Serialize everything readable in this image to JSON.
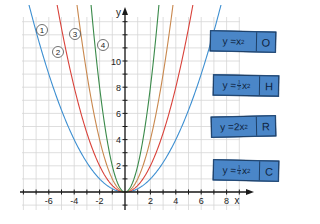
{
  "chart_data": {
    "type": "line",
    "title": "",
    "xlabel": "x",
    "ylabel": "y",
    "xlim": [
      -8,
      9
    ],
    "ylim": [
      -1,
      13.5
    ],
    "grid": true,
    "x_ticks": [
      -6,
      -4,
      -2,
      2,
      4,
      6,
      8
    ],
    "y_ticks": [
      2,
      4,
      6,
      8,
      10
    ],
    "series": [
      {
        "name": "1",
        "marker_label": "①",
        "color": "#3d8fd1",
        "function": "y = 1/4 x^2",
        "a": 0.25
      },
      {
        "name": "2",
        "marker_label": "②",
        "color": "#d9423a",
        "function": "y = 1/2 x^2",
        "a": 0.5
      },
      {
        "name": "3",
        "marker_label": "③",
        "color": "#c9884e",
        "function": "y = x^2",
        "a": 1
      },
      {
        "name": "4",
        "marker_label": "④",
        "color": "#3a8a4a",
        "function": "y = 2x^2",
        "a": 2
      }
    ],
    "annotations": [
      "①",
      "②",
      "③",
      "④"
    ]
  },
  "axes": {
    "x_label": "x",
    "y_label": "y",
    "x_tick_labels": [
      "-6",
      "-4",
      "-2",
      "2",
      "4",
      "6",
      "8"
    ],
    "y_tick_labels": [
      "2",
      "4",
      "6",
      "8",
      "10"
    ]
  },
  "curve_labels": [
    "①",
    "②",
    "③",
    "④"
  ],
  "cards": [
    {
      "formula_prefix": "y = ",
      "coef": "",
      "coef_num": "",
      "coef_den": "",
      "var": "x",
      "exp": "2",
      "letter": "O"
    },
    {
      "formula_prefix": "y = ",
      "coef": "",
      "coef_num": "1",
      "coef_den": "2",
      "var": "x",
      "exp": "2",
      "letter": "H"
    },
    {
      "formula_prefix": "y = ",
      "coef": "2 ",
      "coef_num": "",
      "coef_den": "",
      "var": "x",
      "exp": "2",
      "letter": "R"
    },
    {
      "formula_prefix": "y = ",
      "coef": "",
      "coef_num": "1",
      "coef_den": "4",
      "var": "x",
      "exp": "2",
      "letter": "C"
    }
  ],
  "colors": {
    "grid": "#d6d6d6",
    "axis": "#1a1a1a",
    "card_fill": "#4a86c8",
    "card_border": "#1e3f66"
  }
}
